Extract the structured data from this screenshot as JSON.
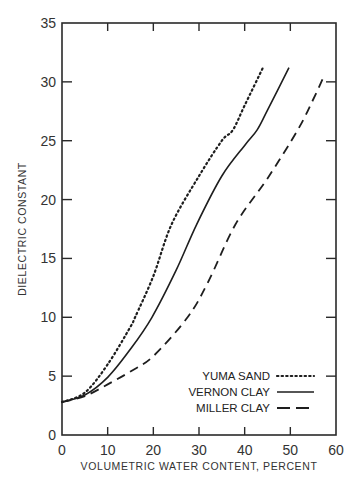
{
  "chart_data": {
    "type": "line",
    "title": "",
    "xlabel": "VOLUMETRIC WATER CONTENT, PERCENT",
    "ylabel": "DIELECTRIC CONSTANT",
    "xlim": [
      0,
      60
    ],
    "ylim": [
      0,
      35
    ],
    "xticks": [
      0,
      10,
      20,
      30,
      40,
      50,
      60
    ],
    "yticks": [
      0,
      5,
      10,
      15,
      20,
      25,
      30,
      35
    ],
    "grid": false,
    "legend_position": "lower right",
    "series": [
      {
        "name": "YUMA SAND",
        "style": "dotted",
        "x": [
          0,
          5,
          10,
          15,
          16,
          20,
          24,
          30,
          35,
          37.4,
          40,
          44
        ],
        "y": [
          2.8,
          3.6,
          6.0,
          9.2,
          10.0,
          13.5,
          17.9,
          22.0,
          25.0,
          25.9,
          28.0,
          31.2
        ]
      },
      {
        "name": "VERNON CLAY",
        "style": "solid",
        "x": [
          0,
          5,
          10,
          15,
          19.7,
          25,
          29.5,
          35,
          40,
          42.7,
          45,
          49.7
        ],
        "y": [
          2.8,
          3.4,
          4.9,
          7.3,
          10.0,
          14.0,
          17.9,
          22.0,
          24.6,
          25.9,
          27.6,
          31.2
        ]
      },
      {
        "name": "MILLER CLAY",
        "style": "dashed",
        "x": [
          0,
          5,
          10,
          15,
          20,
          27.5,
          32,
          38,
          45,
          51.6,
          55,
          57.5
        ],
        "y": [
          2.8,
          3.3,
          4.3,
          5.4,
          6.7,
          10.0,
          13.0,
          17.9,
          21.8,
          25.9,
          28.5,
          30.6
        ]
      }
    ]
  },
  "legend": {
    "items": [
      {
        "label": "YUMA SAND",
        "style": "dotted"
      },
      {
        "label": "VERNON CLAY",
        "style": "solid"
      },
      {
        "label": "MILLER CLAY",
        "style": "dashed"
      }
    ]
  },
  "colors": {
    "axis": "#2a2a2a",
    "line": "#1e1e1e",
    "text": "#333333"
  }
}
